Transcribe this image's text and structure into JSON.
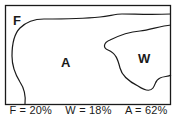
{
  "diagram": {
    "regions": [
      {
        "label": "F",
        "name": "F",
        "percent": "20%"
      },
      {
        "label": "A",
        "name": "A",
        "percent": "62%"
      },
      {
        "label": "W",
        "name": "W",
        "percent": "18%"
      }
    ],
    "caption": {
      "f_text": "F = 20%",
      "w_text": "W = 18%",
      "a_text": "A = 62%"
    },
    "colors": {
      "line": "#1a1a1a",
      "background": "#ffffff"
    }
  }
}
